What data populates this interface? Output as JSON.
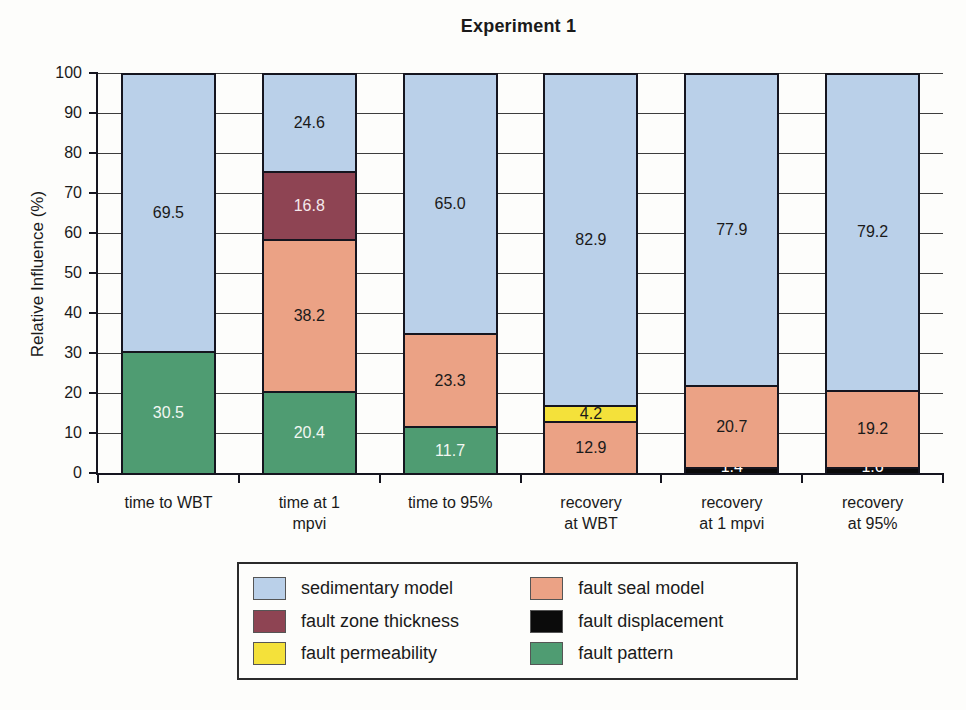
{
  "title": "Experiment 1",
  "y_axis": {
    "label": "Relative Influence (%)",
    "min": 0,
    "max": 100,
    "step": 10
  },
  "colors": {
    "sedimentary_model": "#bad0e9",
    "fault_seal_model": "#eba285",
    "fault_zone_thickness": "#8e4453",
    "fault_displacement": "#0b0b0b",
    "fault_permeability": "#f4e13a",
    "fault_pattern": "#4f9c72",
    "outline": "#15151f"
  },
  "chart_data": {
    "type": "bar",
    "stacked": true,
    "title": "Experiment 1",
    "xlabel": "",
    "ylabel": "Relative Influence (%)",
    "ylim": [
      0,
      100
    ],
    "ytick_step": 10,
    "grid": true,
    "legend_position": "bottom",
    "categories": [
      "time to WBT",
      "time at 1 mpvi",
      "time to 95%",
      "recovery at WBT",
      "recovery at 1 mpvi",
      "recovery at 95%"
    ],
    "category_lines": [
      [
        "time to WBT"
      ],
      [
        "time at 1",
        "mpvi"
      ],
      [
        "time to 95%"
      ],
      [
        "recovery",
        "at WBT"
      ],
      [
        "recovery",
        "at 1 mpvi"
      ],
      [
        "recovery",
        "at 95%"
      ]
    ],
    "series": [
      {
        "name": "fault pattern",
        "color": "#4f9c72",
        "label_color": "#f2f7f2",
        "values": [
          30.5,
          20.4,
          11.7,
          0,
          0,
          0
        ]
      },
      {
        "name": "fault displacement",
        "color": "#0b0b0b",
        "label_color": "#ffffff",
        "values": [
          0,
          0,
          0,
          0,
          1.4,
          1.6
        ]
      },
      {
        "name": "fault seal model",
        "color": "#eba285",
        "label_color": "#1a1a1a",
        "values": [
          0,
          38.2,
          23.3,
          12.9,
          20.7,
          19.2
        ]
      },
      {
        "name": "fault permeability",
        "color": "#f4e13a",
        "label_color": "#1a1a1a",
        "values": [
          0,
          0,
          0,
          4.2,
          0,
          0
        ]
      },
      {
        "name": "fault zone thickness",
        "color": "#8e4453",
        "label_color": "#f5e9ec",
        "values": [
          0,
          16.8,
          0,
          0,
          0,
          0
        ]
      },
      {
        "name": "sedimentary model",
        "color": "#bad0e9",
        "label_color": "#1a1a1a",
        "values": [
          69.5,
          24.6,
          65.0,
          82.9,
          77.9,
          79.2
        ]
      }
    ]
  },
  "legend": {
    "items": [
      {
        "label": "sedimentary model",
        "color": "#bad0e9"
      },
      {
        "label": "fault seal model",
        "color": "#eba285"
      },
      {
        "label": "fault zone thickness",
        "color": "#8e4453"
      },
      {
        "label": "fault displacement",
        "color": "#0b0b0b"
      },
      {
        "label": "fault permeability",
        "color": "#f4e13a"
      },
      {
        "label": "fault pattern",
        "color": "#4f9c72"
      }
    ]
  }
}
